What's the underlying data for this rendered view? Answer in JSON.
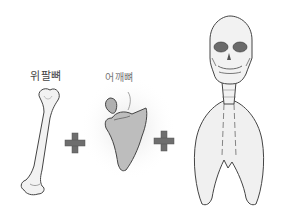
{
  "illustration": {
    "labels": {
      "humerus": "위팔뼈",
      "scapula": "어깨뼈"
    },
    "parts": [
      {
        "name": "humerus",
        "label": "위팔뼈"
      },
      {
        "name": "scapula",
        "label": "어깨뼈"
      },
      {
        "name": "skull-neck-ribcage",
        "label": ""
      }
    ],
    "operators": [
      "+",
      "+"
    ],
    "colors": {
      "bone_fill": "#f2f2f2",
      "bone_stroke": "#444444",
      "scapula_fill": "#bdbdbd",
      "plus_fill": "#6e6e6e",
      "eye_socket": "#6a6a6a",
      "glow": "#e8e8e8"
    }
  }
}
